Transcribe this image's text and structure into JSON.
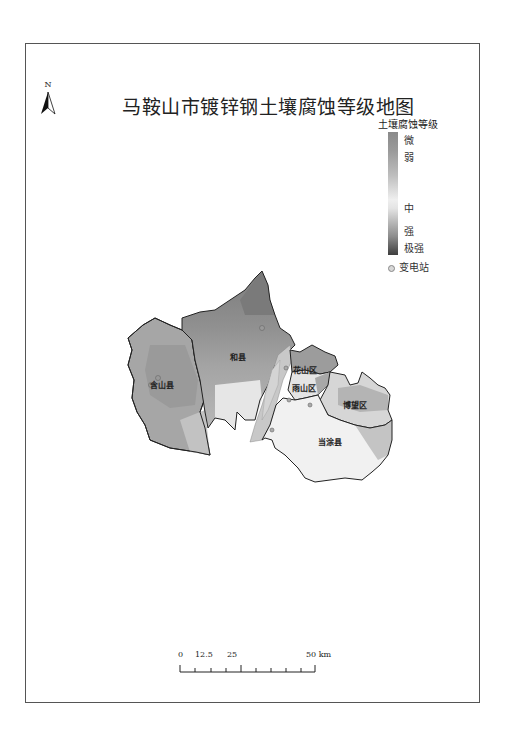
{
  "map": {
    "title": "马鞍山市镀锌钢土壤腐蚀等级地图",
    "north_arrow": {
      "label": "N",
      "icon": "north-arrow-icon"
    },
    "legend": {
      "title": "土壤腐蚀等级",
      "classes": [
        {
          "label": "微",
          "color": "#8a8a8a"
        },
        {
          "label": "弱",
          "color": "#a0a0a0"
        },
        {
          "label": "中",
          "color": "#ededed"
        },
        {
          "label": "强",
          "color": "#8c8c8c"
        },
        {
          "label": "极强",
          "color": "#3e3e3e"
        }
      ],
      "station_label": "变电站",
      "station_icon": "substation-dot-icon"
    },
    "regions": [
      {
        "name": "含山县"
      },
      {
        "name": "和县"
      },
      {
        "name": "花山区"
      },
      {
        "name": "雨山区"
      },
      {
        "name": "博望区"
      },
      {
        "name": "当涂县"
      }
    ],
    "scale_bar": {
      "ticks": [
        "0",
        "12.5",
        "25",
        "50 km"
      ],
      "unit": "km"
    }
  }
}
